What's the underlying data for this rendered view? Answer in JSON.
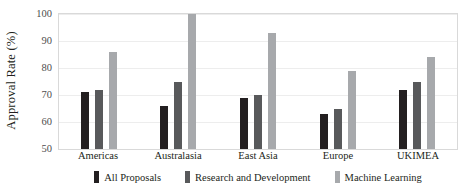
{
  "chart_data": {
    "type": "bar",
    "title": "",
    "xlabel": "",
    "ylabel": "Approval Rate (%)",
    "ylim": [
      50,
      100
    ],
    "yticks": [
      50,
      60,
      70,
      80,
      90,
      100
    ],
    "grid": "horizontal",
    "legend_position": "bottom",
    "categories": [
      "Americas",
      "Australasia",
      "East Asia",
      "Europe",
      "UKIMEA"
    ],
    "series": [
      {
        "name": "All Proposals",
        "color": "#231f20",
        "values": [
          71,
          66,
          69,
          63,
          72
        ]
      },
      {
        "name": "Research and Development",
        "color": "#58595b",
        "values": [
          72,
          75,
          70,
          65,
          75
        ]
      },
      {
        "name": "Machine Learning",
        "color": "#a7a9ac",
        "values": [
          86,
          100,
          93,
          79,
          84
        ]
      }
    ]
  }
}
